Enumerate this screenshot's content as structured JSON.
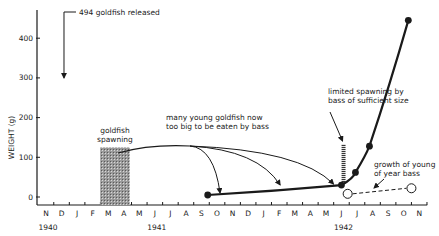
{
  "chart_data": {
    "type": "line",
    "title": "",
    "xlabel": "",
    "ylabel": "WEIGHT (g)",
    "ylim": [
      0,
      460
    ],
    "yticks": [
      0,
      100,
      200,
      300,
      400
    ],
    "grid": false,
    "legend": null,
    "x_months": [
      "N",
      "D",
      "J",
      "F",
      "M",
      "A",
      "M",
      "J",
      "J",
      "A",
      "S",
      "O",
      "N",
      "D",
      "J",
      "F",
      "M",
      "A",
      "M",
      "J",
      "J",
      "A",
      "S",
      "O",
      "N"
    ],
    "year_labels": [
      {
        "label": "1940",
        "month_index": 0
      },
      {
        "label": "1941",
        "month_index": 7
      },
      {
        "label": "1942",
        "month_index": 19
      }
    ],
    "series": [
      {
        "name": "goldfish weight",
        "style": "solid, filled markers",
        "points": [
          {
            "date": "Sep 1941",
            "month_index": 10.4,
            "weight_g": 5
          },
          {
            "date": "Jun 1942",
            "month_index": 19.0,
            "weight_g": 30
          },
          {
            "date": "Jul 1942",
            "month_index": 19.9,
            "weight_g": 62
          },
          {
            "date": "Aug 1942",
            "month_index": 20.8,
            "weight_g": 128
          },
          {
            "date": "Oct 1942",
            "month_index": 23.3,
            "weight_g": 445
          }
        ]
      },
      {
        "name": "growth of young of year bass",
        "style": "dashed, open markers",
        "points": [
          {
            "date": "Jun 1942",
            "month_index": 19.4,
            "weight_g": 8
          },
          {
            "date": "Oct 1942",
            "month_index": 23.5,
            "weight_g": 22
          }
        ]
      }
    ],
    "annotations": [
      {
        "text": "494 goldfish released",
        "month_index": 0.9,
        "arrow_to_weight_g": 300
      },
      {
        "text_lines": [
          "goldfish",
          "spawning"
        ],
        "shaded_months": [
          4.0,
          5.9
        ],
        "shaded_weight_g": [
          0,
          125
        ]
      },
      {
        "text_lines": [
          "many young goldfish now",
          "too big to be eaten by bass"
        ],
        "arrows_to_month_index": [
          11.0,
          14.8,
          18.3
        ]
      },
      {
        "text_lines": [
          "limited spawning by",
          "bass of sufficient size"
        ],
        "hatched_bar_month_index": 19.2,
        "hatched_weight_g": [
          30,
          130
        ]
      },
      {
        "text_lines": [
          "growth of young",
          "of year bass"
        ]
      }
    ]
  }
}
